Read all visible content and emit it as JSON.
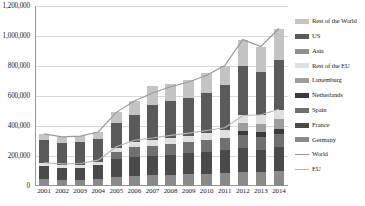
{
  "chart_data": {
    "type": "bar",
    "title": "",
    "subtitle": "",
    "xlabel": "",
    "ylabel": "",
    "stacked": true,
    "grid": true,
    "legend_position": "right",
    "ylim": [
      0,
      1200000
    ],
    "ytick_labels": [
      "1,200,000",
      "1,000,000",
      "800,000",
      "600,000",
      "400,000",
      "200,000",
      "0"
    ],
    "ytick_values": [
      1200000,
      1000000,
      800000,
      600000,
      400000,
      200000,
      0
    ],
    "categories": [
      "2001",
      "2002",
      "2003",
      "2004",
      "2005",
      "2006",
      "2007",
      "2008",
      "2009",
      "2010",
      "2011",
      "2012",
      "2013",
      "2014"
    ],
    "series": [
      {
        "name": "Germany",
        "color": "#8a8a8a",
        "kind": "bar",
        "values": [
          45000,
          42000,
          42000,
          45000,
          62000,
          70000,
          72000,
          75000,
          78000,
          82000,
          88000,
          95000,
          92000,
          98000
        ]
      },
      {
        "name": "France",
        "color": "#4a4a4a",
        "kind": "bar",
        "values": [
          90000,
          80000,
          80000,
          95000,
          115000,
          125000,
          130000,
          135000,
          140000,
          145000,
          150000,
          158000,
          150000,
          160000
        ]
      },
      {
        "name": "Spain",
        "color": "#707070",
        "kind": "bar",
        "values": [
          0,
          0,
          0,
          0,
          48000,
          65000,
          68000,
          72000,
          75000,
          78000,
          82000,
          88000,
          85000,
          90000
        ]
      },
      {
        "name": "Netherlands",
        "color": "#3a3a3a",
        "kind": "bar",
        "values": [
          0,
          0,
          0,
          0,
          0,
          0,
          0,
          0,
          0,
          0,
          0,
          28000,
          30000,
          35000
        ]
      },
      {
        "name": "Luxemburg",
        "color": "#9e9e9e",
        "kind": "bar",
        "values": [
          0,
          0,
          0,
          0,
          0,
          0,
          0,
          0,
          0,
          0,
          0,
          52000,
          58000,
          62000
        ]
      },
      {
        "name": "Rest of the EU",
        "color": "#e0e0e0",
        "kind": "bar",
        "values": [
          20000,
          18000,
          18000,
          20000,
          28000,
          32000,
          35000,
          38000,
          42000,
          48000,
          55000,
          55000,
          60000,
          65000
        ]
      },
      {
        "name": "Asia",
        "color": "#8f8f8f",
        "kind": "bar",
        "values": [
          0,
          0,
          0,
          0,
          0,
          0,
          0,
          0,
          0,
          0,
          0,
          0,
          0,
          0
        ]
      },
      {
        "name": "US",
        "color": "#5a5a5a",
        "kind": "bar",
        "values": [
          155000,
          150000,
          155000,
          155000,
          170000,
          180000,
          235000,
          245000,
          255000,
          270000,
          300000,
          325000,
          285000,
          330000
        ]
      },
      {
        "name": "Rest of the World",
        "color": "#c4c4c4",
        "kind": "bar",
        "values": [
          38000,
          38000,
          38000,
          45000,
          68000,
          95000,
          130000,
          115000,
          120000,
          128000,
          128000,
          175000,
          170000,
          210000
        ]
      },
      {
        "name": "World",
        "color": "#9a9a9a",
        "kind": "line",
        "values": [
          348000,
          328000,
          333000,
          360000,
          491000,
          567000,
          620000,
          662000,
          693000,
          738000,
          803000,
          976000,
          930000,
          1050000
        ]
      },
      {
        "name": "EU",
        "color": "#b5b5b5",
        "kind": "line",
        "values": [
          155000,
          148000,
          150000,
          172000,
          262000,
          305000,
          320000,
          338000,
          352000,
          370000,
          388000,
          470000,
          475000,
          512000
        ]
      }
    ],
    "legend_entries": [
      {
        "label": "Rest of the World",
        "color": "#c4c4c4",
        "kind": "bar"
      },
      {
        "label": "US",
        "color": "#5a5a5a",
        "kind": "bar"
      },
      {
        "label": "Asia",
        "color": "#8f8f8f",
        "kind": "bar"
      },
      {
        "label": "Rest of the EU",
        "color": "#e0e0e0",
        "kind": "bar"
      },
      {
        "label": "Luxemburg",
        "color": "#9e9e9e",
        "kind": "bar"
      },
      {
        "label": "Netherlands",
        "color": "#3a3a3a",
        "kind": "bar"
      },
      {
        "label": "Spain",
        "color": "#707070",
        "kind": "bar"
      },
      {
        "label": "France",
        "color": "#4a4a4a",
        "kind": "bar"
      },
      {
        "label": "Germany",
        "color": "#8a8a8a",
        "kind": "bar"
      },
      {
        "label": "World",
        "color": "#9a9a9a",
        "kind": "line"
      },
      {
        "label": "EU",
        "color": "#b5b5b5",
        "kind": "line"
      }
    ]
  }
}
